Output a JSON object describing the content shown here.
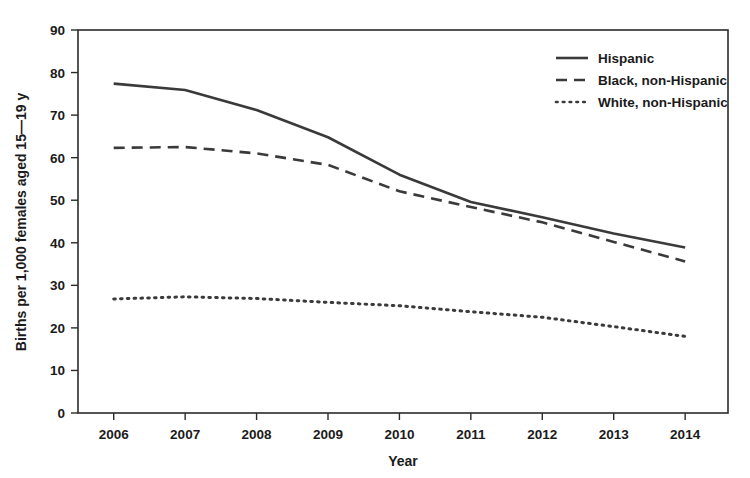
{
  "chart_data": {
    "type": "line",
    "title": "",
    "xlabel": "Year",
    "ylabel": "Births per 1,000 females aged 15—19 y",
    "x": [
      2006,
      2007,
      2008,
      2009,
      2010,
      2011,
      2012,
      2013,
      2014
    ],
    "xtick_labels": [
      "2006",
      "2007",
      "2008",
      "2009",
      "2010",
      "2011",
      "2012",
      "2013",
      "2014"
    ],
    "ytick_labels": [
      "0",
      "10",
      "20",
      "30",
      "40",
      "50",
      "60",
      "70",
      "80",
      "90"
    ],
    "ytick_values": [
      0,
      10,
      20,
      30,
      40,
      50,
      60,
      70,
      80,
      90
    ],
    "xlim": [
      2005.5,
      2014.6
    ],
    "ylim": [
      0,
      90
    ],
    "grid": false,
    "legend_position": "top-right inside axes",
    "series": [
      {
        "name": "Hispanic",
        "style": "solid",
        "color": "#3a3a3a",
        "values": [
          77.4,
          75.9,
          71.2,
          64.8,
          56.0,
          49.6,
          46.0,
          42.2,
          38.9
        ]
      },
      {
        "name": "Black, non-Hispanic",
        "style": "dashed",
        "color": "#3a3a3a",
        "values": [
          62.3,
          62.5,
          61.0,
          58.3,
          52.1,
          48.4,
          44.8,
          40.2,
          35.6
        ]
      },
      {
        "name": "White, non-Hispanic",
        "style": "dotted",
        "color": "#3a3a3a",
        "values": [
          26.8,
          27.3,
          26.9,
          26.0,
          25.2,
          23.8,
          22.5,
          20.3,
          18.0
        ]
      }
    ]
  },
  "axes": {
    "y_axis_title": "Births per 1,000 females aged 15—19 y",
    "x_axis_title": "Year"
  },
  "legend": {
    "items": [
      {
        "label": "Hispanic",
        "style": "solid"
      },
      {
        "label": "Black, non-Hispanic",
        "style": "dashed"
      },
      {
        "label": "White, non-Hispanic",
        "style": "dotted"
      }
    ]
  },
  "colors": {
    "ink": "#3a3a3a",
    "axis": "#2b2b2b",
    "background": "#ffffff"
  }
}
